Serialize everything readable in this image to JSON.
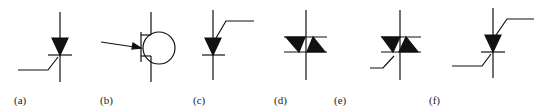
{
  "figure": {
    "symbols": [
      {
        "id": "a",
        "label": "(a)",
        "name": "scr-thyristor"
      },
      {
        "id": "b",
        "label": "(b)",
        "name": "unijunction-transistor"
      },
      {
        "id": "c",
        "label": "(c)",
        "name": "anode-gate-thyristor"
      },
      {
        "id": "d",
        "label": "(d)",
        "name": "diac"
      },
      {
        "id": "e",
        "label": "(e)",
        "name": "triac"
      },
      {
        "id": "f",
        "label": "(f)",
        "name": "silicon-controlled-switch"
      }
    ],
    "stroke_color": "#111111",
    "background": "#ffffff"
  }
}
